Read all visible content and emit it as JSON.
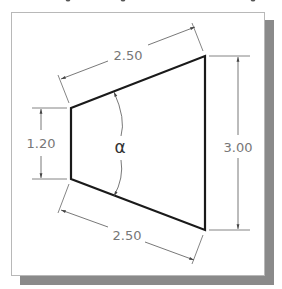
{
  "diagram": {
    "dimensions": {
      "top_slant": "2.50",
      "bottom_slant": "2.50",
      "left_height": "1.20",
      "right_height": "3.00"
    },
    "angle_label": "α",
    "colors": {
      "outline": "#1a1a1a",
      "dimension": "#777777",
      "shadow": "#8a8a8a",
      "frame_border": "#b8b8b8"
    }
  }
}
